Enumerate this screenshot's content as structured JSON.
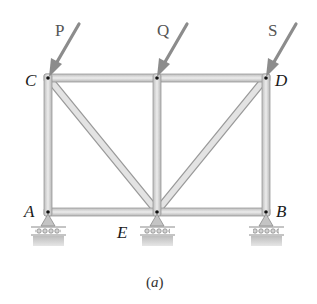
{
  "figure": {
    "caption": "(a)",
    "caption_letter": "a",
    "colors": {
      "member_fill": "#d9d9d9",
      "member_edge": "#9a9a9a",
      "arrow": "#8c8c8c",
      "joint_pin": "#111111",
      "ground": "#c9c9c9",
      "text": "#1a1a1a"
    }
  },
  "loads": [
    {
      "name": "P",
      "label": "P",
      "joint": "C"
    },
    {
      "name": "Q",
      "label": "Q",
      "joint": "top-middle"
    },
    {
      "name": "S",
      "label": "S",
      "joint": "D"
    }
  ],
  "joints": [
    {
      "id": "C",
      "label": "C"
    },
    {
      "id": "D",
      "label": "D"
    },
    {
      "id": "A",
      "label": "A"
    },
    {
      "id": "E",
      "label": "E"
    },
    {
      "id": "B",
      "label": "B"
    }
  ],
  "members": [
    "CD-top-left",
    "CD-top-right",
    "AC",
    "BD",
    "AE",
    "EB",
    "CE",
    "DE",
    "vertical-middle"
  ],
  "supports": [
    {
      "joint": "A",
      "type": "roller"
    },
    {
      "joint": "E",
      "type": "roller"
    },
    {
      "joint": "B",
      "type": "roller"
    }
  ]
}
